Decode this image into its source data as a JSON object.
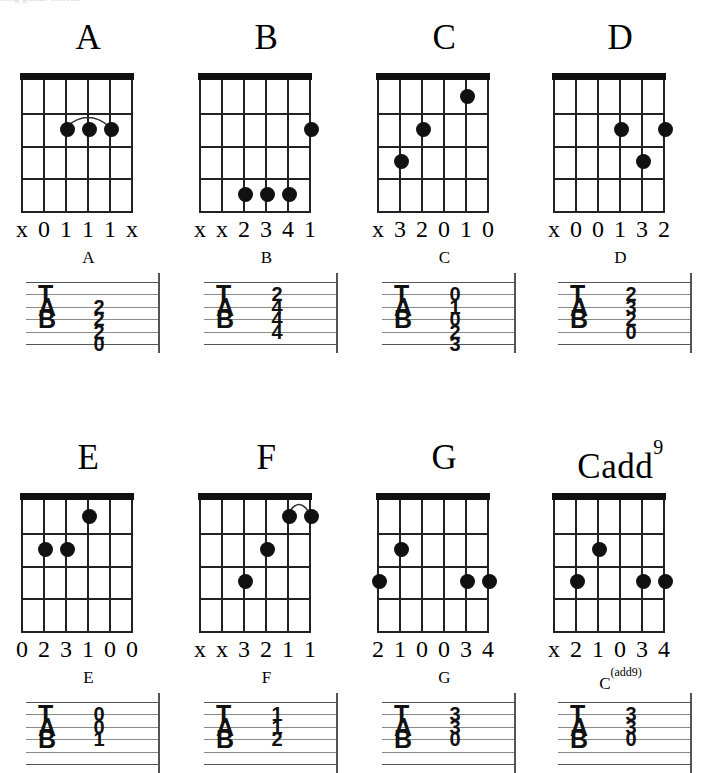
{
  "page": {
    "background_color": "#ffffff",
    "ink_color": "#111111",
    "tab_line_color": "#8a8a8a",
    "top_artifact_text": "hing guitar chords"
  },
  "diagram_spec": {
    "strings": 6,
    "frets": 4,
    "tab_lines": 6,
    "tab_letters": [
      "T",
      "A",
      "B"
    ]
  },
  "rows": [
    {
      "row_name": "row-1",
      "chords": [
        {
          "name": "A",
          "title": "A",
          "title_sup": "",
          "tab_title": "A",
          "tab_title_sup": "",
          "markers": [
            "x",
            "0",
            "1",
            "1",
            "1",
            "x"
          ],
          "dots": [
            {
              "string": 3,
              "fret": 2
            },
            {
              "string": 4,
              "fret": 2
            },
            {
              "string": 5,
              "fret": 2
            }
          ],
          "barre": {
            "from_string": 3,
            "to_string": 5,
            "fret": 2
          },
          "tab_numbers": [
            {
              "line": 2,
              "value": "2"
            },
            {
              "line": 3,
              "value": "2"
            },
            {
              "line": 4,
              "value": "2"
            },
            {
              "line": 5,
              "value": "0"
            }
          ]
        },
        {
          "name": "B",
          "title": "B",
          "title_sup": "",
          "tab_title": "B",
          "tab_title_sup": "",
          "markers": [
            "x",
            "x",
            "2",
            "3",
            "4",
            "1"
          ],
          "dots": [
            {
              "string": 6,
              "fret": 2
            },
            {
              "string": 3,
              "fret": 4
            },
            {
              "string": 4,
              "fret": 4
            },
            {
              "string": 5,
              "fret": 4
            }
          ],
          "barre": null,
          "tab_numbers": [
            {
              "line": 1,
              "value": "2"
            },
            {
              "line": 2,
              "value": "4"
            },
            {
              "line": 3,
              "value": "4"
            },
            {
              "line": 4,
              "value": "4"
            }
          ]
        },
        {
          "name": "C",
          "title": "C",
          "title_sup": "",
          "tab_title": "C",
          "tab_title_sup": "",
          "markers": [
            "x",
            "3",
            "2",
            "0",
            "1",
            "0"
          ],
          "dots": [
            {
              "string": 5,
              "fret": 1
            },
            {
              "string": 3,
              "fret": 2
            },
            {
              "string": 2,
              "fret": 3
            }
          ],
          "barre": null,
          "tab_numbers": [
            {
              "line": 1,
              "value": "0"
            },
            {
              "line": 2,
              "value": "1"
            },
            {
              "line": 3,
              "value": "0"
            },
            {
              "line": 4,
              "value": "2"
            },
            {
              "line": 5,
              "value": "3"
            }
          ]
        },
        {
          "name": "D",
          "title": "D",
          "title_sup": "",
          "tab_title": "D",
          "tab_title_sup": "",
          "markers": [
            "x",
            "0",
            "0",
            "1",
            "3",
            "2"
          ],
          "dots": [
            {
              "string": 4,
              "fret": 2
            },
            {
              "string": 6,
              "fret": 2
            },
            {
              "string": 5,
              "fret": 3
            }
          ],
          "barre": null,
          "tab_numbers": [
            {
              "line": 1,
              "value": "2"
            },
            {
              "line": 2,
              "value": "3"
            },
            {
              "line": 3,
              "value": "2"
            },
            {
              "line": 4,
              "value": "0"
            }
          ]
        }
      ]
    },
    {
      "row_name": "row-2",
      "chords": [
        {
          "name": "E",
          "title": "E",
          "title_sup": "",
          "tab_title": "E",
          "tab_title_sup": "",
          "markers": [
            "0",
            "2",
            "3",
            "1",
            "0",
            "0"
          ],
          "dots": [
            {
              "string": 4,
              "fret": 1
            },
            {
              "string": 2,
              "fret": 2
            },
            {
              "string": 3,
              "fret": 2
            }
          ],
          "barre": null,
          "tab_numbers": [
            {
              "line": 1,
              "value": "0"
            },
            {
              "line": 2,
              "value": "0"
            },
            {
              "line": 3,
              "value": "1"
            }
          ]
        },
        {
          "name": "F",
          "title": "F",
          "title_sup": "",
          "tab_title": "F",
          "tab_title_sup": "",
          "markers": [
            "x",
            "x",
            "3",
            "2",
            "1",
            "1"
          ],
          "dots": [
            {
              "string": 5,
              "fret": 1
            },
            {
              "string": 6,
              "fret": 1
            },
            {
              "string": 4,
              "fret": 2
            },
            {
              "string": 3,
              "fret": 3
            }
          ],
          "barre": {
            "from_string": 5,
            "to_string": 6,
            "fret": 1
          },
          "tab_numbers": [
            {
              "line": 1,
              "value": "1"
            },
            {
              "line": 2,
              "value": "1"
            },
            {
              "line": 3,
              "value": "2"
            }
          ]
        },
        {
          "name": "G",
          "title": "G",
          "title_sup": "",
          "tab_title": "G",
          "tab_title_sup": "",
          "markers": [
            "2",
            "1",
            "0",
            "0",
            "3",
            "4"
          ],
          "dots": [
            {
              "string": 2,
              "fret": 2
            },
            {
              "string": 1,
              "fret": 3
            },
            {
              "string": 5,
              "fret": 3
            },
            {
              "string": 6,
              "fret": 3
            }
          ],
          "barre": null,
          "tab_numbers": [
            {
              "line": 1,
              "value": "3"
            },
            {
              "line": 2,
              "value": "3"
            },
            {
              "line": 3,
              "value": "0"
            }
          ]
        },
        {
          "name": "Cadd9",
          "title": "Cadd",
          "title_sup": "9",
          "tab_title": "C",
          "tab_title_sup": "(add9)",
          "markers": [
            "x",
            "2",
            "1",
            "0",
            "3",
            "4"
          ],
          "dots": [
            {
              "string": 3,
              "fret": 2
            },
            {
              "string": 2,
              "fret": 3
            },
            {
              "string": 5,
              "fret": 3
            },
            {
              "string": 6,
              "fret": 3
            }
          ],
          "barre": null,
          "tab_numbers": [
            {
              "line": 1,
              "value": "3"
            },
            {
              "line": 2,
              "value": "3"
            },
            {
              "line": 3,
              "value": "0"
            }
          ]
        }
      ]
    }
  ]
}
